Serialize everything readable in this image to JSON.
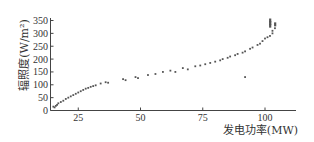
{
  "chart_data": {
    "type": "scatter",
    "title": "",
    "xlabel": "发电功率(MW)",
    "ylabel": "辐照度(W/m²)",
    "xlim": [
      13.7,
      112
    ],
    "ylim": [
      0,
      350
    ],
    "xticks": [
      25,
      50,
      75,
      100
    ],
    "yticks": [
      0,
      50,
      100,
      150,
      200,
      250,
      300,
      350
    ],
    "grid": false,
    "legend": null,
    "series": [
      {
        "name": "辐照度-发电功率",
        "color": "#555555",
        "points": [
          [
            15,
            15
          ],
          [
            15.5,
            12
          ],
          [
            16,
            18
          ],
          [
            16.5,
            22
          ],
          [
            17,
            28
          ],
          [
            18,
            33
          ],
          [
            19,
            38
          ],
          [
            20,
            45
          ],
          [
            21,
            50
          ],
          [
            22,
            55
          ],
          [
            23,
            60
          ],
          [
            24,
            65
          ],
          [
            25,
            70
          ],
          [
            26,
            75
          ],
          [
            27,
            80
          ],
          [
            28,
            85
          ],
          [
            29,
            88
          ],
          [
            30,
            92
          ],
          [
            31,
            95
          ],
          [
            32,
            98
          ],
          [
            34,
            105
          ],
          [
            36,
            110
          ],
          [
            37,
            108
          ],
          [
            43,
            122
          ],
          [
            44,
            118
          ],
          [
            48,
            130
          ],
          [
            49,
            126
          ],
          [
            53,
            138
          ],
          [
            56,
            142
          ],
          [
            59,
            150
          ],
          [
            62,
            155
          ],
          [
            64,
            150
          ],
          [
            67,
            165
          ],
          [
            69,
            160
          ],
          [
            72,
            172
          ],
          [
            74,
            175
          ],
          [
            76,
            180
          ],
          [
            78,
            185
          ],
          [
            80,
            190
          ],
          [
            82,
            195
          ],
          [
            83,
            200
          ],
          [
            85,
            205
          ],
          [
            86,
            210
          ],
          [
            88,
            215
          ],
          [
            89,
            220
          ],
          [
            91,
            225
          ],
          [
            92,
            230
          ],
          [
            94,
            240
          ],
          [
            95,
            245
          ],
          [
            97,
            255
          ],
          [
            98,
            260
          ],
          [
            99,
            270
          ],
          [
            100,
            280
          ],
          [
            101,
            285
          ],
          [
            102,
            290
          ],
          [
            103,
            300
          ],
          [
            102,
            330
          ],
          [
            102,
            340
          ],
          [
            102,
            350
          ],
          [
            103,
            310
          ],
          [
            104,
            320
          ],
          [
            104,
            335
          ],
          [
            92,
            130
          ]
        ]
      }
    ]
  },
  "labels": {
    "x_axis": "发电功率(MW)",
    "y_axis": "辐照度(W/m²)"
  }
}
